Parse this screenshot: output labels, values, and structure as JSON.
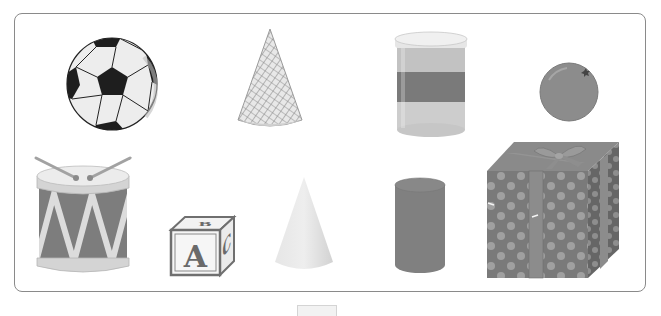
{
  "figure": {
    "objects": [
      {
        "id": "soccer-ball",
        "row": 1,
        "col": 1,
        "shape": "sphere"
      },
      {
        "id": "waffle-cone",
        "row": 1,
        "col": 2,
        "shape": "cone"
      },
      {
        "id": "canister",
        "row": 1,
        "col": 3,
        "shape": "cylinder"
      },
      {
        "id": "orange",
        "row": 1,
        "col": 4,
        "shape": "sphere"
      },
      {
        "id": "drum",
        "row": 2,
        "col": 1,
        "shape": "cylinder"
      },
      {
        "id": "alphabet-block",
        "row": 2,
        "col": 2,
        "shape": "cube",
        "letters": [
          "A",
          "B",
          "C"
        ]
      },
      {
        "id": "plain-cone",
        "row": 2,
        "col": 3,
        "shape": "cone"
      },
      {
        "id": "plain-cylinder",
        "row": 2,
        "col": 4,
        "shape": "cylinder"
      },
      {
        "id": "gift-box",
        "row": 2,
        "col": 5,
        "shape": "cube"
      }
    ],
    "block_letters": {
      "front": "A",
      "top": "B",
      "side": "C"
    }
  },
  "colors": {
    "frame_border": "#8a8a8a",
    "ball_dark": "#1e1e1e",
    "ball_light": "#ededed",
    "cone_waffle": "#b5b5b5",
    "canister_band": "#7a7a7a",
    "canister_body": "#b8b8b8",
    "orange": "#8c8c8c",
    "drum_body": "#7d7d7d",
    "drum_rim": "#cfcfcf",
    "block_face": "#f4f4f4",
    "block_edge": "#6f6f6f",
    "plain_cone": "#e2e2e2",
    "plain_cylinder": "#808080",
    "gift_box": "#7a7a7a",
    "gift_dots": "#a0a0a0"
  }
}
